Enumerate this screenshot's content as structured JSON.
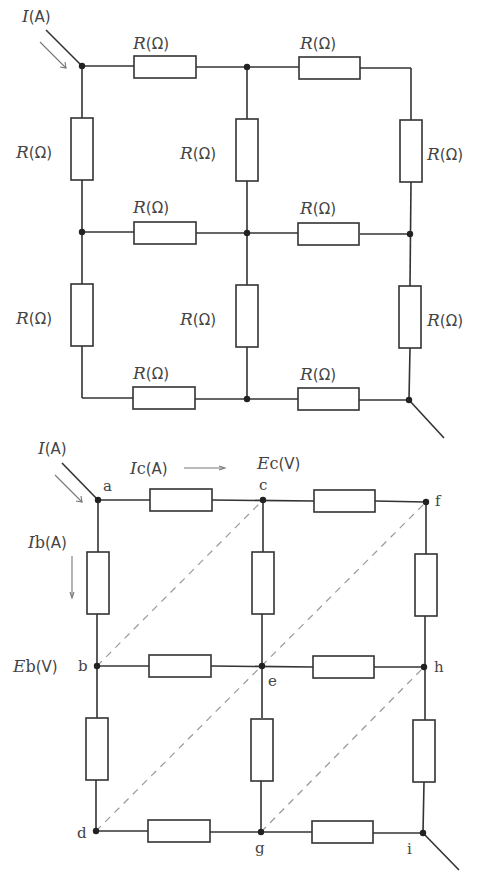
{
  "top_diagram": {
    "current_label": {
      "var": "I",
      "unit": "(A)"
    },
    "resistor_label": {
      "var": "R",
      "unit": "(Ω)"
    },
    "resistor_count": 12,
    "grid": "3x3 nodes"
  },
  "bottom_diagram": {
    "current_label": {
      "var": "I",
      "unit": "(A)"
    },
    "ic_label": {
      "var": "I",
      "sub": "c",
      "unit": "(A)"
    },
    "ib_label": {
      "var": "I",
      "sub": "b",
      "unit": "(A)"
    },
    "ec_label": {
      "var": "E",
      "sub": "c",
      "unit": "(V)"
    },
    "eb_label": {
      "var": "E",
      "sub": "b",
      "unit": "(V)"
    },
    "nodes": {
      "a": "a",
      "b": "b",
      "c": "c",
      "d": "d",
      "e": "e",
      "f": "f",
      "g": "g",
      "h": "h",
      "i": "i"
    },
    "equipotential_lines": [
      "b-c",
      "d-e-f",
      "g-h"
    ]
  }
}
